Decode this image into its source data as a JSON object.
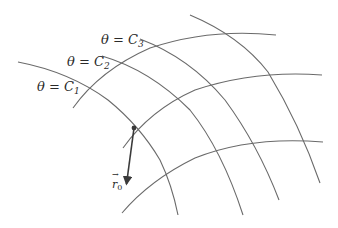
{
  "diagram": {
    "title": "",
    "labels": {
      "theta_c1": {
        "lhs": "θ",
        "eq": " = ",
        "rhs": "C",
        "sub": "1"
      },
      "theta_c2": {
        "lhs": "θ",
        "eq": " = ",
        "rhs": "C",
        "sub": "2"
      },
      "theta_c3": {
        "lhs": "θ",
        "eq": " = ",
        "rhs": "C",
        "sub": "3"
      },
      "r0": {
        "sym": "r",
        "sub": "0"
      }
    },
    "colors": {
      "curve": "#6a6a6a",
      "arrow": "#3a3a3a",
      "text": "#2a2a2a",
      "background": "#ffffff"
    },
    "point": {
      "x": 134,
      "y": 128
    },
    "arrow_tip": {
      "x": 126,
      "y": 186
    }
  }
}
